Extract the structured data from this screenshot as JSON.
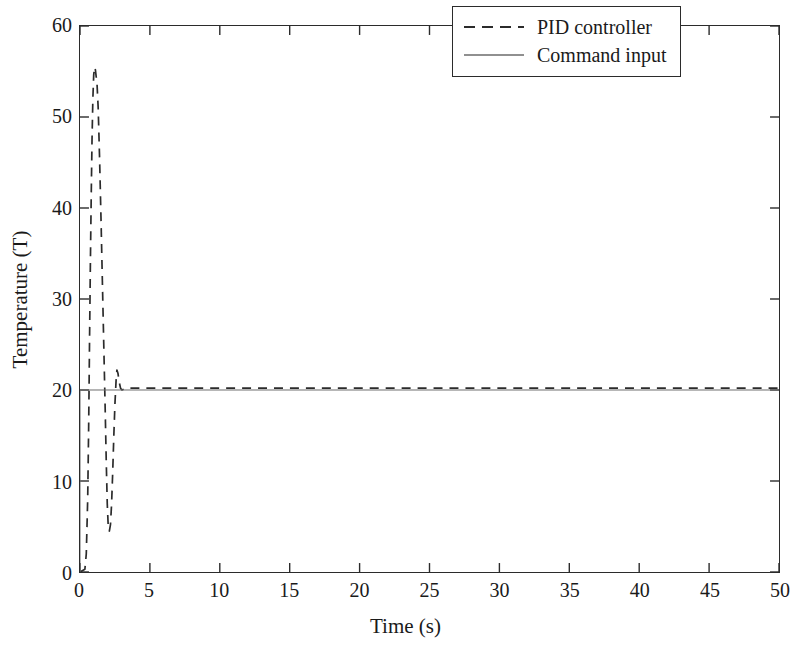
{
  "chart_data": {
    "type": "line",
    "title": "",
    "xlabel": "Time (s)",
    "ylabel": "Temperature (T)",
    "xlim": [
      0,
      50
    ],
    "ylim": [
      0,
      60
    ],
    "xticks": [
      0,
      5,
      10,
      15,
      20,
      25,
      30,
      35,
      40,
      45,
      50
    ],
    "yticks": [
      0,
      10,
      20,
      30,
      40,
      50,
      60
    ],
    "xtick_labels": [
      "0",
      "5",
      "10",
      "15",
      "20",
      "25",
      "30",
      "35",
      "40",
      "45",
      "50"
    ],
    "ytick_labels": [
      "0",
      "10",
      "20",
      "30",
      "40",
      "50",
      "60"
    ],
    "grid": false,
    "legend_position": "upper right",
    "frame": "box",
    "tick_direction": "in",
    "series": [
      {
        "name": "PID controller",
        "style": "dashed",
        "color": "#2b2b2b",
        "linewidth": 1.7,
        "dash_pattern": [
          9,
          7
        ],
        "x": [
          0.0,
          0.35,
          0.45,
          0.55,
          0.62,
          0.68,
          0.74,
          0.8,
          0.86,
          0.92,
          0.98,
          1.04,
          1.1,
          1.16,
          1.22,
          1.3,
          1.4,
          1.5,
          1.6,
          1.7,
          1.8,
          1.88,
          1.95,
          2.02,
          2.1,
          2.18,
          2.26,
          2.34,
          2.42,
          2.5,
          2.58,
          2.64,
          2.72,
          2.8,
          2.9,
          3.0,
          3.15,
          3.3,
          3.5,
          3.8,
          4.2,
          5.0,
          7.0,
          10.0,
          15.0,
          20.0,
          25.0,
          30.0,
          35.0,
          40.0,
          45.0,
          50.0
        ],
        "y": [
          0.0,
          0.3,
          2.0,
          8.0,
          16.0,
          25.0,
          33.5,
          41.0,
          47.5,
          52.0,
          54.6,
          55.5,
          55.2,
          54.4,
          53.6,
          51.0,
          45.5,
          39.0,
          32.0,
          25.0,
          18.0,
          12.0,
          7.5,
          5.0,
          4.5,
          5.2,
          7.5,
          11.0,
          15.0,
          18.5,
          21.0,
          22.2,
          21.8,
          20.9,
          20.2,
          20.0,
          20.1,
          20.2,
          20.2,
          20.2,
          20.2,
          20.2,
          20.2,
          20.2,
          20.2,
          20.2,
          20.2,
          20.2,
          20.2,
          20.2,
          20.2,
          20.2
        ],
        "peak_value": 55.5,
        "peak_time": 1.04,
        "undershoot_value": 4.5,
        "undershoot_time": 2.1,
        "second_overshoot_value": 22.2,
        "second_overshoot_time": 2.64,
        "steady_state_value": 20.2
      },
      {
        "name": "Command input",
        "style": "solid",
        "color": "#6b6b6b",
        "linewidth": 1.0,
        "x": [
          0.0,
          0.0,
          50.0
        ],
        "y": [
          0.0,
          20.0,
          20.0
        ],
        "setpoint": 20
      }
    ]
  },
  "axes": {
    "xlabel": "Time (s)",
    "ylabel": "Temperature (T)",
    "xtick_labels": [
      "0",
      "5",
      "10",
      "15",
      "20",
      "25",
      "30",
      "35",
      "40",
      "45",
      "50"
    ],
    "ytick_labels": [
      "0",
      "10",
      "20",
      "30",
      "40",
      "50",
      "60"
    ]
  },
  "legend": {
    "entries": [
      {
        "label": "PID controller",
        "style": "dashed",
        "color": "#2b2b2b"
      },
      {
        "label": "Command input",
        "style": "solid",
        "color": "#6b6b6b"
      }
    ]
  },
  "colors": {
    "background": "#ffffff",
    "axis": "#2b2b2b",
    "text": "#1a1a1a",
    "pid_line": "#2b2b2b",
    "command_line": "#6b6b6b"
  }
}
